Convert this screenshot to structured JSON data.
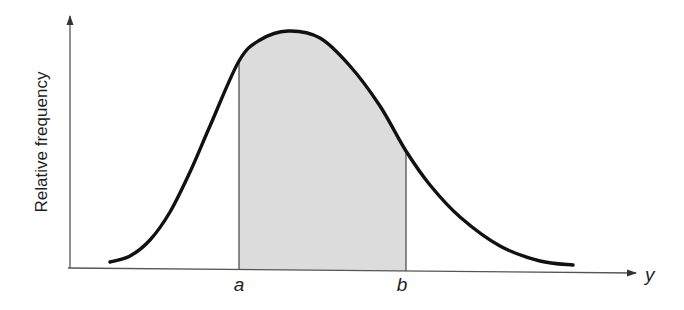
{
  "chart_data": {
    "type": "area",
    "title": "",
    "xlabel": "y",
    "ylabel": "Relative frequency",
    "tick_labels": [
      "a",
      "b"
    ],
    "shaded_region": {
      "from": "a",
      "to": "b",
      "color": "#dcdcdc"
    },
    "grid": false,
    "legend": null,
    "curve_color": "#111111",
    "axis_color": "#555555",
    "curve_points_px": [
      [
        110,
        262
      ],
      [
        130,
        256
      ],
      [
        150,
        240
      ],
      [
        170,
        212
      ],
      [
        190,
        172
      ],
      [
        210,
        126
      ],
      [
        239,
        61
      ],
      [
        260,
        40
      ],
      [
        288,
        31
      ],
      [
        320,
        38
      ],
      [
        350,
        66
      ],
      [
        380,
        106
      ],
      [
        406,
        151
      ],
      [
        430,
        185
      ],
      [
        460,
        217
      ],
      [
        500,
        246
      ],
      [
        540,
        261
      ],
      [
        573,
        265
      ]
    ],
    "a_px": 239,
    "b_px": 406
  },
  "labels": {
    "y_axis": "Relative frequency",
    "x_axis": "y",
    "a": "a",
    "b": "b"
  }
}
